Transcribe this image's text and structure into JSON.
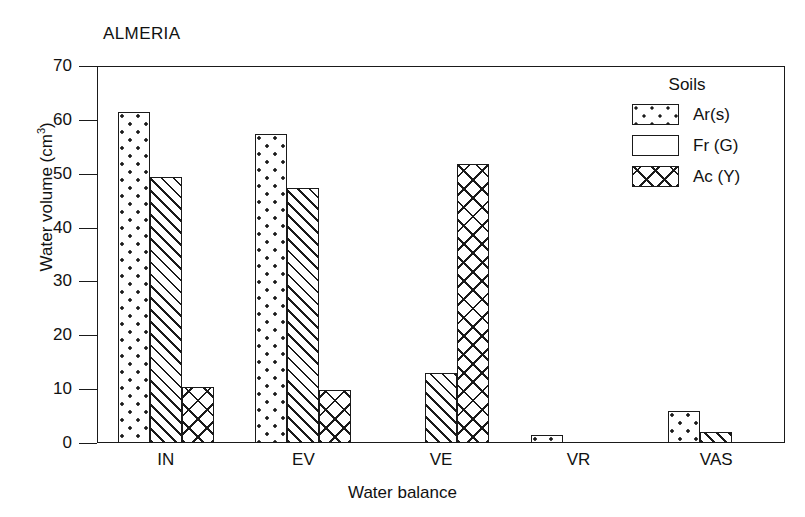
{
  "chart_data": {
    "type": "bar",
    "title": "ALMERIA",
    "xlabel": "Water balance",
    "ylabel": "Water volume (cm3)",
    "ylabel_base": "Water volume (cm",
    "ylabel_sup": "3",
    "ylabel_close": ")",
    "categories": [
      "IN",
      "EV",
      "VE",
      "VR",
      "VAS"
    ],
    "ylim": [
      0,
      70
    ],
    "yticks": [
      0,
      10,
      20,
      30,
      40,
      50,
      60,
      70
    ],
    "ytick_labels": [
      "0",
      "10",
      "20",
      "30",
      "40",
      "50",
      "60",
      "70"
    ],
    "grid": false,
    "legend_position": "top-right",
    "legend_title": "Soils",
    "series": [
      {
        "name": "Ar(s)",
        "pattern": "dots",
        "values": [
          61.4,
          57.3,
          0,
          1.5,
          6.0
        ]
      },
      {
        "name": "Fr (G)",
        "pattern": "hatch",
        "values": [
          49.4,
          47.3,
          13.0,
          0,
          2.1
        ]
      },
      {
        "name": "Ac (Y)",
        "pattern": "cross",
        "values": [
          10.4,
          9.8,
          51.8,
          0,
          0
        ]
      }
    ]
  },
  "colors": {
    "ink": "#1a1a1a",
    "paper": "#ffffff"
  }
}
